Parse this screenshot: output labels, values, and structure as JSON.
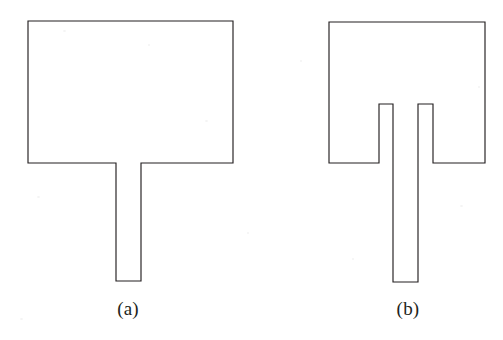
{
  "figure": {
    "background_color": "#ffffff",
    "stroke_color": "#231f20",
    "stroke_width": 1.15,
    "canvas": {
      "width": 503,
      "height": 340
    },
    "panels": [
      {
        "id": "a",
        "caption": "(a)",
        "description": "rectangular patch antenna with single microstrip feed line",
        "caption_center": {
          "x": 128,
          "y": 310
        },
        "patch": {
          "left": 28,
          "top": 21,
          "right": 233,
          "bottom": 163,
          "width": 205,
          "height": 142
        },
        "feed_line": {
          "left": 116,
          "right": 141,
          "top": 163,
          "bottom": 281,
          "width": 25,
          "length": 118
        },
        "outline_points": "28,21 233,21 233,163 141,163 141,281 116,281 116,163 28,163"
      },
      {
        "id": "b",
        "caption": "(b)",
        "description": "rectangular patch antenna with two vertical slots flanking the microstrip feed line",
        "caption_center": {
          "x": 408,
          "y": 310
        },
        "patch": {
          "left": 329,
          "top": 22,
          "right": 485,
          "bottom": 163,
          "width": 156,
          "height": 141
        },
        "feed_line": {
          "left": 393,
          "right": 420,
          "top": 163,
          "bottom": 282,
          "width": 27,
          "length": 119
        },
        "slot_left": {
          "left": 379,
          "right": 393,
          "top": 104,
          "bottom": 163,
          "width": 14,
          "depth": 59
        },
        "slot_right": {
          "left": 418,
          "right": 433,
          "top": 104,
          "bottom": 163,
          "width": 15,
          "depth": 59
        },
        "outline_points": "329,22 485,22 485,163 433,163 433,104 418,104 418,282 393,282 393,104 379,104 379,163 329,163"
      }
    ]
  }
}
